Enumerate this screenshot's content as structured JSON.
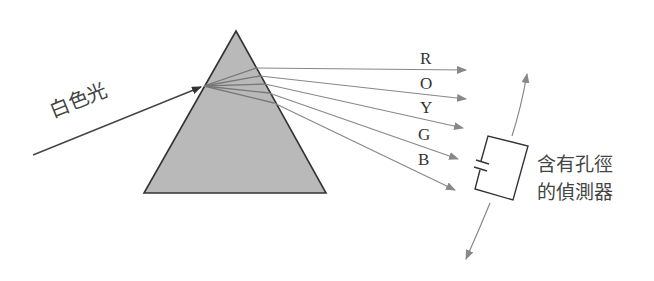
{
  "diagram": {
    "incident_label": "白色光",
    "ray_labels": [
      "R",
      "O",
      "Y",
      "G",
      "B"
    ],
    "detector_label_line1": "含有孔徑",
    "detector_label_line2": "的偵測器",
    "colors": {
      "prism_fill": "#b8b8b8",
      "prism_stroke": "#333333",
      "ray": "#888888",
      "text": "#333333"
    }
  }
}
